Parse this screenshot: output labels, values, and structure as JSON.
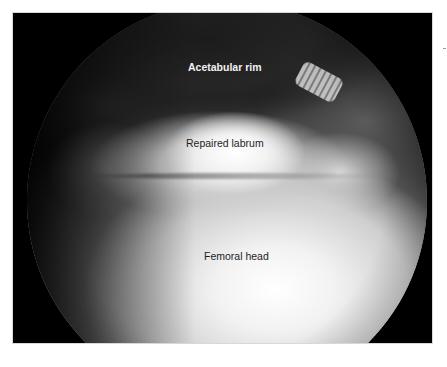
{
  "figure": {
    "type": "arthroscopic image",
    "view": "circular arthroscope field within black rectangular frame",
    "colors": {
      "frame_background": "#000000",
      "page_background": "#ffffff",
      "label_on_dark": "#f2f2f2",
      "label_on_light": "#1e1e1e"
    },
    "labels": {
      "acetabular_rim": "Acetabular rim",
      "repaired_labrum": "Repaired labrum",
      "femoral_head": "Femoral head"
    }
  }
}
